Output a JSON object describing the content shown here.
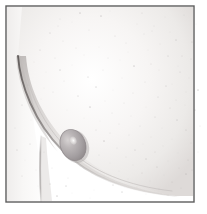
{
  "figure": {
    "kind": "anatomical-illustration",
    "medium": "graphite-pencil-drawing",
    "title": "",
    "caption": "",
    "background_color": "#ffffff",
    "canvas": {
      "width": 207,
      "height": 214
    }
  },
  "frame": {
    "name": "image-border",
    "x": 6,
    "y": 6,
    "width": 188,
    "height": 196,
    "stroke_color": "#5d5d5d",
    "stroke_width": 1.4,
    "fill_color": "#ffffff"
  },
  "shading": {
    "skin_light": "#f4f2f0",
    "skin_mid": "#e2dedc",
    "skin_shadow": "#c8c3c1",
    "contour_line": "#9a9594",
    "contour_line_dark": "#6f6a69",
    "lesion_fill": "#b9b4b4",
    "lesion_shadow": "#8f8a8c",
    "lesion_highlight": "#f3f1ef",
    "speckle_color": "#b9b6b6"
  },
  "elements": [
    {
      "name": "breast-contour-curve",
      "description": "long sweeping underside contour of the breast from upper-left down to lower-right",
      "path": "M 18 56 C 20 84, 34 122, 62 150 C 90 178, 128 192, 176 196"
    },
    {
      "name": "torso-arm-line",
      "description": "vertical body / arm contour descending from the breast fold to the bottom border",
      "path": "M 40 138 C 40 160, 40 182, 41 201"
    },
    {
      "name": "nodule-lesion",
      "description": "oval nodule with specular highlight sitting on the breast surface",
      "cx": 73,
      "cy": 145,
      "rx": 12.5,
      "ry": 16,
      "rotation": -22,
      "highlight": {
        "cx": 75,
        "cy": 141,
        "rx": 3.2,
        "ry": 4.2
      }
    },
    {
      "name": "upper-breast-shading",
      "description": "soft graphite gradient filling the breast mass above the contour"
    },
    {
      "name": "paper-speckle-texture",
      "description": "scattered faint stipple dots across the whole plate",
      "dot_count": 140
    }
  ],
  "speckles": [
    [
      101,
      16
    ],
    [
      72,
      22
    ],
    [
      137,
      24
    ],
    [
      89,
      30
    ],
    [
      152,
      31
    ],
    [
      50,
      33
    ],
    [
      115,
      36
    ],
    [
      196,
      24
    ],
    [
      63,
      41
    ],
    [
      126,
      43
    ],
    [
      176,
      40
    ],
    [
      99,
      47
    ],
    [
      40,
      50
    ],
    [
      148,
      50
    ],
    [
      84,
      55
    ],
    [
      168,
      56
    ],
    [
      55,
      58
    ],
    [
      120,
      60
    ],
    [
      191,
      59
    ],
    [
      72,
      65
    ],
    [
      134,
      66
    ],
    [
      103,
      70
    ],
    [
      159,
      70
    ],
    [
      46,
      72
    ],
    [
      180,
      72
    ],
    [
      88,
      77
    ],
    [
      122,
      78
    ],
    [
      64,
      81
    ],
    [
      145,
      82
    ],
    [
      172,
      84
    ],
    [
      96,
      87
    ],
    [
      113,
      90
    ],
    [
      53,
      92
    ],
    [
      133,
      93
    ],
    [
      186,
      92
    ],
    [
      78,
      96
    ],
    [
      158,
      97
    ],
    [
      41,
      99
    ],
    [
      105,
      101
    ],
    [
      124,
      103
    ],
    [
      90,
      107
    ],
    [
      146,
      107
    ],
    [
      170,
      108
    ],
    [
      67,
      110
    ],
    [
      112,
      113
    ],
    [
      195,
      110
    ],
    [
      131,
      116
    ],
    [
      84,
      118
    ],
    [
      155,
      117
    ],
    [
      100,
      121
    ],
    [
      177,
      120
    ],
    [
      119,
      124
    ],
    [
      140,
      126
    ],
    [
      162,
      128
    ],
    [
      96,
      130
    ],
    [
      186,
      130
    ],
    [
      110,
      133
    ],
    [
      129,
      135
    ],
    [
      151,
      137
    ],
    [
      172,
      139
    ],
    [
      104,
      141
    ],
    [
      143,
      144
    ],
    [
      163,
      146
    ],
    [
      191,
      143
    ],
    [
      117,
      148
    ],
    [
      135,
      150
    ],
    [
      155,
      152
    ],
    [
      178,
      153
    ],
    [
      99,
      155
    ],
    [
      126,
      157
    ],
    [
      146,
      159
    ],
    [
      168,
      161
    ],
    [
      188,
      160
    ],
    [
      110,
      163
    ],
    [
      133,
      165
    ],
    [
      157,
      167
    ],
    [
      179,
      168
    ],
    [
      119,
      171
    ],
    [
      142,
      173
    ],
    [
      164,
      175
    ],
    [
      186,
      174
    ],
    [
      104,
      177
    ],
    [
      128,
      179
    ],
    [
      150,
      181
    ],
    [
      172,
      182
    ],
    [
      113,
      185
    ],
    [
      137,
      187
    ],
    [
      159,
      189
    ],
    [
      181,
      188
    ],
    [
      94,
      190
    ],
    [
      122,
      192
    ],
    [
      146,
      194
    ],
    [
      168,
      195
    ],
    [
      58,
      26
    ],
    [
      34,
      62
    ],
    [
      28,
      85
    ],
    [
      22,
      105
    ],
    [
      31,
      120
    ],
    [
      48,
      130
    ],
    [
      60,
      19
    ],
    [
      80,
      13
    ],
    [
      110,
      11
    ],
    [
      142,
      13
    ],
    [
      165,
      17
    ],
    [
      184,
      15
    ],
    [
      192,
      42
    ],
    [
      189,
      78
    ],
    [
      185,
      105
    ],
    [
      192,
      170
    ],
    [
      90,
      198
    ],
    [
      66,
      186
    ],
    [
      52,
      168
    ],
    [
      44,
      152
    ],
    [
      38,
      186
    ],
    [
      22,
      176
    ],
    [
      17,
      150
    ],
    [
      15,
      128
    ],
    [
      68,
      178
    ],
    [
      80,
      166
    ],
    [
      92,
      173
    ],
    [
      57,
      196
    ],
    [
      72,
      193
    ],
    [
      160,
      44
    ],
    [
      144,
      34
    ],
    [
      176,
      100
    ],
    [
      166,
      86
    ],
    [
      151,
      64
    ],
    [
      128,
      52
    ],
    [
      108,
      58
    ],
    [
      76,
      48
    ],
    [
      60,
      70
    ],
    [
      44,
      88
    ],
    [
      30,
      144
    ],
    [
      25,
      160
    ],
    [
      36,
      170
    ],
    [
      50,
      184
    ],
    [
      154,
      26
    ],
    [
      170,
      32
    ],
    [
      182,
      56
    ],
    [
      178,
      66
    ],
    [
      198,
      90
    ],
    [
      200,
      126
    ],
    [
      198,
      152
    ]
  ],
  "legend": {
    "present": false,
    "items": []
  },
  "axes": {
    "present": false
  }
}
